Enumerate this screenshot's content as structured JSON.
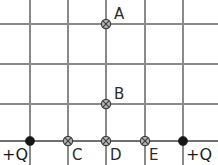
{
  "diagram": {
    "width": 218,
    "height": 165,
    "background_color": "#ffffff",
    "grid": {
      "line_color": "#8a8a8a",
      "baseline_color": "#707070",
      "vertical_lines_x": [
        30,
        68,
        106,
        145,
        183
      ],
      "horizontal_lines_y": [
        24,
        64,
        104
      ],
      "baseline_y": 141,
      "vertical_top_y": 0,
      "vertical_bottom_y": 165,
      "horizontal_left_x": 0,
      "horizontal_right_x": 218
    },
    "charges": [
      {
        "id": "charge-left",
        "label": "+Q",
        "x": 30,
        "y": 141,
        "radius": 4.6,
        "color": "#161616",
        "label_x": 2,
        "label_y": 160,
        "label_anchor": "start"
      },
      {
        "id": "charge-right",
        "label": "+Q",
        "x": 183,
        "y": 141,
        "radius": 4.6,
        "color": "#161616",
        "label_x": 186,
        "label_y": 160,
        "label_anchor": "start"
      }
    ],
    "field_points": [
      {
        "id": "point-a",
        "label": "A",
        "x": 106,
        "y": 24,
        "radius": 4.6,
        "fill": "#b4b4b4",
        "stroke": "#3c3c3c",
        "label_x": 114,
        "label_y": 19,
        "label_anchor": "start"
      },
      {
        "id": "point-b",
        "label": "B",
        "x": 106,
        "y": 104,
        "radius": 4.6,
        "fill": "#b4b4b4",
        "stroke": "#3c3c3c",
        "label_x": 114,
        "label_y": 99,
        "label_anchor": "start"
      },
      {
        "id": "point-c",
        "label": "C",
        "x": 68,
        "y": 141,
        "radius": 4.6,
        "fill": "#b4b4b4",
        "stroke": "#3c3c3c",
        "label_x": 72,
        "label_y": 160,
        "label_anchor": "start"
      },
      {
        "id": "point-d",
        "label": "D",
        "x": 106,
        "y": 141,
        "radius": 4.6,
        "fill": "#b4b4b4",
        "stroke": "#3c3c3c",
        "label_x": 110,
        "label_y": 160,
        "label_anchor": "start"
      },
      {
        "id": "point-e",
        "label": "E",
        "x": 145,
        "y": 141,
        "radius": 4.6,
        "fill": "#b4b4b4",
        "stroke": "#3c3c3c",
        "label_x": 149,
        "label_y": 160,
        "label_anchor": "start"
      }
    ]
  }
}
